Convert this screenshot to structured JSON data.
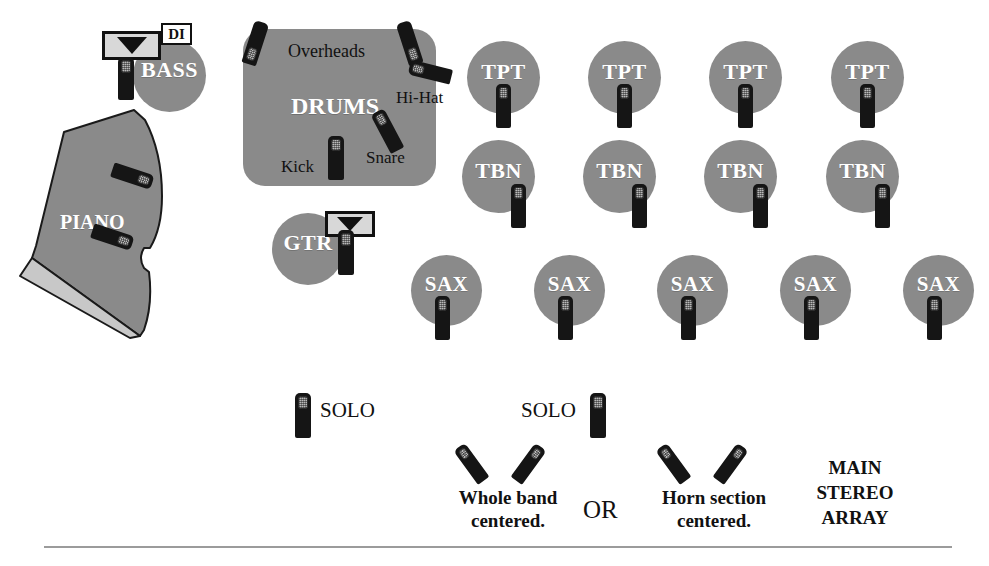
{
  "diagram": {
    "colors": {
      "circle_gray": "#8a8a8a",
      "mic_body": "#151515",
      "mic_grille": "#b9b9b9",
      "piano_body": "#8a8a8a",
      "piano_keys": "#c8c8c8",
      "amp_face": "#d8d8d8",
      "text_dark": "#111111",
      "text_light": "#ffffff",
      "rule": "#9b9b9b",
      "background": "#ffffff"
    }
  },
  "rhythm_section": {
    "bass": {
      "label": "BASS",
      "di_label": "DI",
      "amp_icon": "speaker-cabinet-icon",
      "mic_icon": "microphone-icon"
    },
    "piano": {
      "label": "PIANO",
      "mic_count": 2,
      "mic_icon": "microphone-icon"
    },
    "guitar": {
      "label": "GTR",
      "amp_icon": "speaker-cabinet-icon",
      "mic_icon": "microphone-icon"
    }
  },
  "drums": {
    "label": "DRUMS",
    "mic_labels": [
      "Overheads",
      "Hi-Hat",
      "Snare",
      "Kick"
    ],
    "overheads_label": "Overheads",
    "hihat_label": "Hi-Hat",
    "snare_label": "Snare",
    "kick_label": "Kick",
    "mic_count": 5
  },
  "horns": {
    "trumpets": {
      "label": "TPT",
      "count": 4,
      "items": [
        {
          "label": "TPT"
        },
        {
          "label": "TPT"
        },
        {
          "label": "TPT"
        },
        {
          "label": "TPT"
        }
      ]
    },
    "trombones": {
      "label": "TBN",
      "count": 4,
      "items": [
        {
          "label": "TBN"
        },
        {
          "label": "TBN"
        },
        {
          "label": "TBN"
        },
        {
          "label": "TBN"
        }
      ]
    },
    "saxes": {
      "label": "SAX",
      "count": 5,
      "items": [
        {
          "label": "SAX"
        },
        {
          "label": "SAX"
        },
        {
          "label": "SAX"
        },
        {
          "label": "SAX"
        },
        {
          "label": "SAX"
        }
      ]
    }
  },
  "solo_mics": {
    "left_label": "SOLO",
    "right_label": "SOLO",
    "mic_icon": "microphone-icon"
  },
  "stereo_array": {
    "heading_line1": "MAIN",
    "heading_line2": "STEREO",
    "heading_line3": "ARRAY",
    "option_a_line1": "Whole band",
    "option_a_line2": "centered.",
    "conjunction": "OR",
    "option_b_line1": "Horn section",
    "option_b_line2": "centered.",
    "pair_icon": "xy-stereo-mic-pair-icon",
    "pair_count": 2
  }
}
